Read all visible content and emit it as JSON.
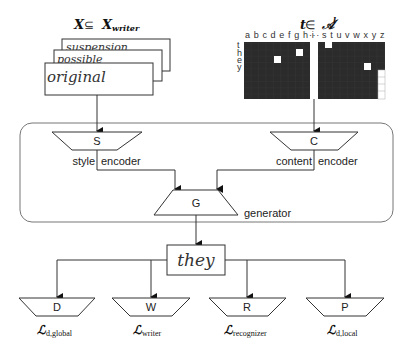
{
  "inputs": {
    "style_input": {
      "title_main": "X",
      "title_op": " ⊆ ",
      "title_set": "X",
      "title_sub": "writer",
      "samples": [
        "original",
        "possible",
        "suspension"
      ]
    },
    "content_input": {
      "title_var": "t",
      "title_op": " ∈ ",
      "title_set": "𝒜",
      "title_sup": "l",
      "alphabet_left": "a b c d e f g h i",
      "ellipsis": "···",
      "alphabet_right": "s t u v w x y z",
      "row_labels": [
        "t",
        "h",
        "e",
        "y"
      ],
      "word": "they"
    }
  },
  "encoders": {
    "style": {
      "symbol": "S",
      "label_left": "style",
      "label_right": "encoder"
    },
    "content": {
      "symbol": "C",
      "label_left": "content",
      "label_right": "encoder"
    }
  },
  "generator": {
    "symbol": "G",
    "label": "generator"
  },
  "output": {
    "word": "they"
  },
  "heads": [
    {
      "symbol": "D",
      "loss_main": "ℒ",
      "loss_sub": "d,global"
    },
    {
      "symbol": "W",
      "loss_main": "ℒ",
      "loss_sub": "writer"
    },
    {
      "symbol": "R",
      "loss_main": "ℒ",
      "loss_sub": "recognizer"
    },
    {
      "symbol": "P",
      "loss_main": "ℒ",
      "loss_sub": "d,local"
    }
  ],
  "colors": {
    "stroke": "#333333",
    "grid_fill": "#2b2b2b",
    "grid_on": "#ffffff",
    "container_stroke": "#666666"
  }
}
